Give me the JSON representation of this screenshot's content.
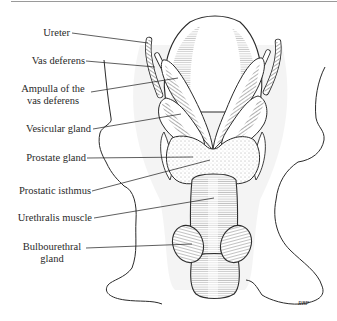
{
  "figure": {
    "signature": "RBP",
    "colors": {
      "ink": "#2a2a2a",
      "rule": "#9a9a9a",
      "background": "#ffffff"
    }
  },
  "labels": [
    {
      "id": "ureter",
      "line1": "Ureter",
      "line2": "",
      "x": 38,
      "y": 27,
      "w": 32,
      "align": "right",
      "leader": [
        72,
        33,
        148,
        43
      ]
    },
    {
      "id": "vas-deferens",
      "line1": "Vas deferens",
      "line2": "",
      "x": 22,
      "y": 55,
      "w": 63,
      "align": "right",
      "leader": [
        86,
        61,
        155,
        67
      ]
    },
    {
      "id": "ampulla",
      "line1": "Ampulla of the",
      "line2": "vas deferens",
      "x": 18,
      "y": 83,
      "w": 72,
      "align": "center",
      "leader": [
        91,
        92,
        178,
        78
      ]
    },
    {
      "id": "vesicular-gland",
      "line1": "Vesicular gland",
      "line2": "",
      "x": 18,
      "y": 123,
      "w": 72,
      "align": "right",
      "leader": [
        93,
        129,
        181,
        114
      ]
    },
    {
      "id": "prostate-gland",
      "line1": "Prostate gland",
      "line2": "",
      "x": 20,
      "y": 152,
      "w": 66,
      "align": "right",
      "leader": [
        87,
        158,
        193,
        157
      ]
    },
    {
      "id": "prostatic-isthmus",
      "line1": "Prostatic isthmus",
      "line2": "",
      "x": 12,
      "y": 185,
      "w": 78,
      "align": "right",
      "leader": [
        92,
        191,
        210,
        160
      ]
    },
    {
      "id": "urethralis-muscle",
      "line1": "Urethralis muscle",
      "line2": "",
      "x": 12,
      "y": 212,
      "w": 79,
      "align": "right",
      "leader": [
        94,
        218,
        214,
        198
      ]
    },
    {
      "id": "bulbourethral-gland",
      "line1": "Bulbourethral",
      "line2": "gland",
      "x": 20,
      "y": 241,
      "w": 64,
      "align": "center",
      "leader": [
        86,
        248,
        192,
        244
      ]
    }
  ]
}
